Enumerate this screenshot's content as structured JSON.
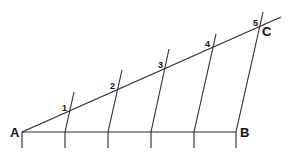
{
  "diagram": {
    "points": {
      "A": {
        "label": "A",
        "x": 22,
        "y": 132
      },
      "B": {
        "label": "B",
        "x": 236,
        "y": 132
      },
      "C": {
        "label": "C",
        "x": 260,
        "y": 26
      }
    },
    "division_marks": [
      {
        "label": "1",
        "x": 69,
        "y": 111
      },
      {
        "label": "2",
        "x": 117,
        "y": 90
      },
      {
        "label": "3",
        "x": 164,
        "y": 69
      },
      {
        "label": "4",
        "x": 212,
        "y": 48
      },
      {
        "label": "5",
        "x": 260,
        "y": 27
      }
    ],
    "baseline_ticks_x": [
      22,
      65,
      108,
      151,
      194,
      236
    ]
  }
}
